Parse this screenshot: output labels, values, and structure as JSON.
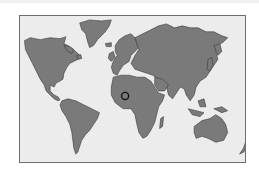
{
  "map": {
    "type": "world-map",
    "style": "grayscale-silhouette",
    "colors": {
      "land": "#7a7a7a",
      "ocean": "#ececec",
      "border": "#6e6e6e",
      "coastline": "#3a3a3a",
      "marker": "#111111"
    },
    "continents": [
      "North America",
      "Greenland",
      "South America",
      "Europe",
      "Africa",
      "Asia",
      "Australia",
      "New Zealand"
    ],
    "marker": {
      "icon": "location-ring-icon",
      "region": "West Africa"
    }
  }
}
